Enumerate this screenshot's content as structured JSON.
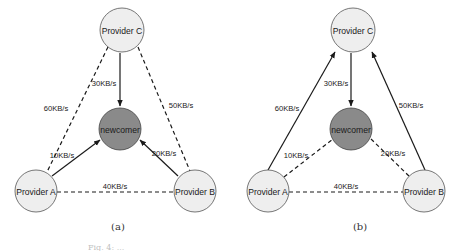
{
  "colors": {
    "provider_fill": "#eeeeee",
    "newcomer_fill": "#8a8a8a",
    "edge": "#1a1a1a"
  },
  "panels": [
    {
      "label": "(a)",
      "nodes": {
        "provider_c": "Provider C",
        "newcomer": "newcomer",
        "provider_a": "Provider A",
        "provider_b": "Provider B"
      },
      "edges": {
        "c_to_newcomer": {
          "label": "30KB/s",
          "style": "solid-arrow",
          "direction": "Provider C -> newcomer"
        },
        "a_to_newcomer": {
          "label": "10KB/s",
          "style": "solid-arrow",
          "direction": "Provider A -> newcomer"
        },
        "b_to_newcomer": {
          "label": "20KB/s",
          "style": "solid-arrow",
          "direction": "Provider B -> newcomer"
        },
        "a_c": {
          "label": "60KB/s",
          "style": "dashed",
          "direction": "Provider A -- Provider C"
        },
        "b_c": {
          "label": "50KB/s",
          "style": "dashed",
          "direction": "Provider B -- Provider C"
        },
        "a_b": {
          "label": "40KB/s",
          "style": "dashed",
          "direction": "Provider A -- Provider B"
        }
      }
    },
    {
      "label": "(b)",
      "nodes": {
        "provider_c": "Provider C",
        "newcomer": "newcomer",
        "provider_a": "Provider A",
        "provider_b": "Provider B"
      },
      "edges": {
        "c_to_newcomer": {
          "label": "30KB/s",
          "style": "solid-arrow",
          "direction": "Provider C -> newcomer"
        },
        "a_to_c": {
          "label": "60KB/s",
          "style": "solid-arrow",
          "direction": "Provider A -> Provider C"
        },
        "b_to_c": {
          "label": "50KB/s",
          "style": "solid-arrow",
          "direction": "Provider B -> Provider C"
        },
        "a_newcomer": {
          "label": "10KB/s",
          "style": "dashed",
          "direction": "Provider A -- newcomer"
        },
        "b_newcomer": {
          "label": "20KB/s",
          "style": "dashed",
          "direction": "Provider B -- newcomer"
        },
        "a_b": {
          "label": "40KB/s",
          "style": "dashed",
          "direction": "Provider A -- Provider B"
        }
      }
    }
  ],
  "caption": "Fig. 4: ..."
}
